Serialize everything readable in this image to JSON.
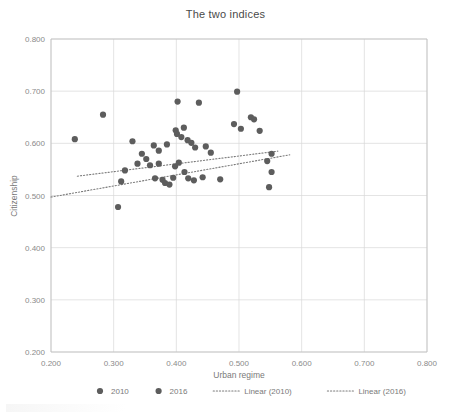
{
  "chart_data": {
    "type": "scatter",
    "title": "The two indices",
    "xlabel": "Urban regime",
    "ylabel": "Citizenship",
    "xlim": [
      0.2,
      0.8
    ],
    "ylim": [
      0.2,
      0.8
    ],
    "xticks": [
      "0.200",
      "0.300",
      "0.400",
      "0.500",
      "0.600",
      "0.700",
      "0.800"
    ],
    "yticks": [
      "0.200",
      "0.300",
      "0.400",
      "0.500",
      "0.600",
      "0.700",
      "0.800"
    ],
    "grid": true,
    "legend_position": "bottom",
    "legend": [
      "2010",
      "2016",
      "Linear (2010)",
      "Linear (2016)"
    ],
    "marker_color": "#5d5d5d",
    "trendline_color": "#7a7a7a",
    "series": [
      {
        "name": "2016",
        "marker": "circle",
        "points": [
          [
            0.283,
            0.655
          ],
          [
            0.402,
            0.68
          ],
          [
            0.436,
            0.678
          ],
          [
            0.497,
            0.699
          ],
          [
            0.33,
            0.604
          ],
          [
            0.345,
            0.58
          ],
          [
            0.364,
            0.596
          ],
          [
            0.372,
            0.586
          ],
          [
            0.385,
            0.598
          ],
          [
            0.399,
            0.625
          ],
          [
            0.401,
            0.618
          ],
          [
            0.408,
            0.612
          ],
          [
            0.412,
            0.63
          ],
          [
            0.418,
            0.606
          ],
          [
            0.424,
            0.601
          ],
          [
            0.43,
            0.592
          ],
          [
            0.447,
            0.594
          ],
          [
            0.455,
            0.582
          ],
          [
            0.492,
            0.637
          ],
          [
            0.503,
            0.628
          ],
          [
            0.519,
            0.65
          ],
          [
            0.524,
            0.646
          ],
          [
            0.533,
            0.624
          ],
          [
            0.552,
            0.58
          ]
        ]
      },
      {
        "name": "2010",
        "marker": "circle",
        "points": [
          [
            0.238,
            0.608
          ],
          [
            0.312,
            0.527
          ],
          [
            0.307,
            0.478
          ],
          [
            0.318,
            0.548
          ],
          [
            0.338,
            0.561
          ],
          [
            0.352,
            0.57
          ],
          [
            0.358,
            0.558
          ],
          [
            0.366,
            0.533
          ],
          [
            0.372,
            0.561
          ],
          [
            0.378,
            0.53
          ],
          [
            0.382,
            0.524
          ],
          [
            0.389,
            0.521
          ],
          [
            0.395,
            0.534
          ],
          [
            0.398,
            0.556
          ],
          [
            0.404,
            0.563
          ],
          [
            0.413,
            0.545
          ],
          [
            0.419,
            0.533
          ],
          [
            0.428,
            0.529
          ],
          [
            0.442,
            0.535
          ],
          [
            0.47,
            0.531
          ],
          [
            0.545,
            0.566
          ],
          [
            0.552,
            0.545
          ],
          [
            0.548,
            0.516
          ]
        ]
      }
    ],
    "trendlines": [
      {
        "name": "Linear (2010)",
        "x_start": 0.242,
        "y_start": 0.537,
        "x_end": 0.562,
        "y_end": 0.585
      },
      {
        "name": "Linear (2016)",
        "x_start": 0.2,
        "y_start": 0.497,
        "x_end": 0.581,
        "y_end": 0.578
      }
    ]
  },
  "legend_items": [
    {
      "label": "2010",
      "kind": "marker"
    },
    {
      "label": "2016",
      "kind": "marker"
    },
    {
      "label": "Linear (2010)",
      "kind": "dotted-line"
    },
    {
      "label": "Linear (2016)",
      "kind": "dotted-line"
    }
  ]
}
